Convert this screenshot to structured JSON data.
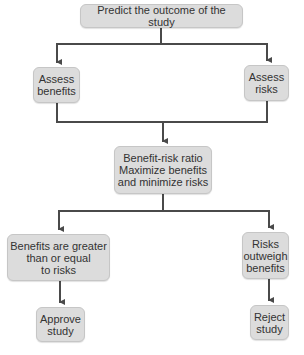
{
  "diagram": {
    "type": "flowchart",
    "colors": {
      "node_fill": "#dcdcdc",
      "node_border": "#c6c6c6",
      "text": "#333333",
      "connector": "#4a4a4a"
    },
    "nodes": {
      "predict": {
        "label": "Predict the outcome of the study"
      },
      "assess_benefits": {
        "label": "Assess\nbenefits"
      },
      "assess_risks": {
        "label": "Assess\nrisks"
      },
      "ratio": {
        "label": "Benefit-risk ratio\nMaximize benefits\nand minimize risks"
      },
      "benefits_greater": {
        "label": "Benefits are greater\nthan or equal\nto risks"
      },
      "risks_outweigh": {
        "label": "Risks\noutweigh\nbenefits"
      },
      "approve": {
        "label": "Approve\nstudy"
      },
      "reject": {
        "label": "Reject\nstudy"
      }
    },
    "edges": [
      {
        "from": "predict",
        "to": "assess_benefits"
      },
      {
        "from": "predict",
        "to": "assess_risks"
      },
      {
        "from": "assess_benefits",
        "to": "ratio"
      },
      {
        "from": "assess_risks",
        "to": "ratio"
      },
      {
        "from": "ratio",
        "to": "benefits_greater"
      },
      {
        "from": "ratio",
        "to": "risks_outweigh"
      },
      {
        "from": "benefits_greater",
        "to": "approve"
      },
      {
        "from": "risks_outweigh",
        "to": "reject"
      }
    ]
  }
}
